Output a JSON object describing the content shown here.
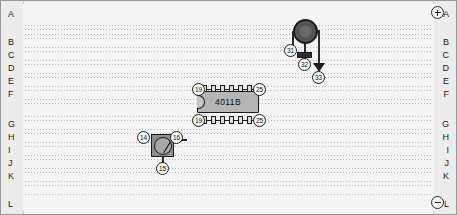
{
  "board": {
    "title": "electronics-breadboard",
    "row_labels": [
      "A",
      "B",
      "C",
      "D",
      "E",
      "F",
      "G",
      "H",
      "I",
      "J",
      "K",
      "L"
    ],
    "terminals": {
      "positive": {
        "label": "+",
        "row": "A",
        "name": "positive-terminal"
      },
      "negative": {
        "label": "−",
        "row": "L",
        "name": "negative-terminal"
      }
    }
  },
  "components": {
    "ic": {
      "part_number": "4011B",
      "top_pin_left": "19",
      "top_pin_right": "25",
      "bottom_pin_left": "19",
      "bottom_pin_right": "25",
      "pin_count_per_row": 6
    },
    "meter": {
      "left_node": "14",
      "right_node": "16",
      "bottom_node": "15"
    },
    "buzzer": {
      "left_node": "31",
      "block_node": "32",
      "arrow_node": "33"
    }
  },
  "colors": {
    "board_background": "#f4f4f4",
    "gutter": "#ececec",
    "ink": "#1d1d1d",
    "ic_body": "#b5b5b5",
    "meter_body": "#8f8f8f",
    "buzzer": "#5a5a5a",
    "contact_dots": "#b9b9b9"
  }
}
